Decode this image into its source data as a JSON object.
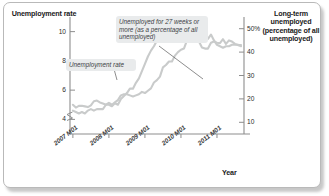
{
  "axes": {
    "y_left_title": "Unemployment rate",
    "y_right_title": "Long-term unemployed (percentage of all unemployed)",
    "x_title": "Year"
  },
  "annotations": {
    "longterm_label": "Unemployed for 27 weeks or more (as a percentage of all unemployed)",
    "unemployment_rate_label": "Unemployment rate"
  },
  "chart_data": {
    "type": "line",
    "title": "",
    "xlabel": "Year",
    "ylabel": "Unemployment rate",
    "y2label": "Long-term unemployed (percentage of all unemployed)",
    "grid": false,
    "legend": "annotations",
    "x_tick_labels": [
      "2007 M01",
      "2008 M01",
      "2009 M01",
      "2010 M01",
      "2011 M01"
    ],
    "x_tick_values": [
      2007.0,
      2008.0,
      2009.0,
      2010.0,
      2011.0
    ],
    "xlim": [
      2006.92,
      2011.75
    ],
    "ylim_left": [
      3.0,
      11.0
    ],
    "ylim_right": [
      5.0,
      55.0
    ],
    "y_left_ticks": [
      4,
      6,
      8,
      10
    ],
    "y_left_tick_labels": [
      "4",
      "6",
      "8",
      "10"
    ],
    "y_right_ticks": [
      10,
      20,
      30,
      40,
      50
    ],
    "y_right_tick_labels": [
      "10",
      "20",
      "30",
      "40",
      "50%"
    ],
    "y_left_axis_break": true,
    "line_color": "#c9cbcb",
    "series": [
      {
        "name": "Unemployment rate",
        "axis": "left",
        "units": "percent",
        "x": [
          2007.0,
          2007.083,
          2007.167,
          2007.25,
          2007.333,
          2007.417,
          2007.5,
          2007.583,
          2007.667,
          2007.75,
          2007.833,
          2007.917,
          2008.0,
          2008.083,
          2008.167,
          2008.25,
          2008.333,
          2008.417,
          2008.5,
          2008.583,
          2008.667,
          2008.75,
          2008.833,
          2008.917,
          2009.0,
          2009.083,
          2009.167,
          2009.25,
          2009.333,
          2009.417,
          2009.5,
          2009.583,
          2009.667,
          2009.75,
          2009.833,
          2009.917,
          2010.0,
          2010.083,
          2010.167,
          2010.25,
          2010.333,
          2010.417,
          2010.5,
          2010.583,
          2010.667,
          2010.75,
          2010.833,
          2010.917,
          2011.0,
          2011.083,
          2011.167,
          2011.25,
          2011.333,
          2011.417,
          2011.5,
          2011.583,
          2011.667
        ],
        "values": [
          4.6,
          4.5,
          4.4,
          4.5,
          4.4,
          4.6,
          4.7,
          4.6,
          4.7,
          4.7,
          4.7,
          5.0,
          5.0,
          4.9,
          5.1,
          5.0,
          5.4,
          5.6,
          5.8,
          6.1,
          6.1,
          6.5,
          6.8,
          7.3,
          7.8,
          8.3,
          8.7,
          9.0,
          9.4,
          9.5,
          9.5,
          9.6,
          9.8,
          10.0,
          9.9,
          9.9,
          9.8,
          9.8,
          9.9,
          9.9,
          9.6,
          9.4,
          9.5,
          9.5,
          9.5,
          9.5,
          9.8,
          9.4,
          9.1,
          9.0,
          8.9,
          9.0,
          9.0,
          9.1,
          9.1,
          9.1,
          9.0
        ]
      },
      {
        "name": "Unemployed for 27 weeks or more (as a percentage of all unemployed)",
        "axis": "right",
        "units": "percent",
        "x": [
          2007.0,
          2007.083,
          2007.167,
          2007.25,
          2007.333,
          2007.417,
          2007.5,
          2007.583,
          2007.667,
          2007.75,
          2007.833,
          2007.917,
          2008.0,
          2008.083,
          2008.167,
          2008.25,
          2008.333,
          2008.417,
          2008.5,
          2008.583,
          2008.667,
          2008.75,
          2008.833,
          2008.917,
          2009.0,
          2009.083,
          2009.167,
          2009.25,
          2009.333,
          2009.417,
          2009.5,
          2009.583,
          2009.667,
          2009.75,
          2009.833,
          2009.917,
          2010.0,
          2010.083,
          2010.167,
          2010.25,
          2010.333,
          2010.417,
          2010.5,
          2010.583,
          2010.667,
          2010.75,
          2010.833,
          2010.917,
          2011.0,
          2011.083,
          2011.167,
          2011.25,
          2011.333,
          2011.417,
          2011.5,
          2011.583,
          2011.667
        ],
        "values": [
          17.5,
          16.3,
          17.0,
          17.1,
          16.8,
          16.5,
          17.2,
          19.0,
          19.3,
          18.5,
          18.0,
          17.5,
          18.3,
          17.5,
          18.5,
          19.5,
          21.5,
          22.0,
          22.0,
          21.5,
          21.0,
          21.5,
          22.0,
          23.0,
          22.5,
          23.5,
          24.5,
          27.0,
          28.0,
          29.5,
          33.5,
          34.5,
          36.0,
          36.0,
          38.5,
          40.0,
          41.0,
          41.5,
          45.0,
          46.0,
          46.0,
          45.5,
          44.5,
          42.0,
          41.5,
          41.5,
          44.0,
          44.5,
          44.0,
          43.8,
          45.5,
          43.5,
          45.0,
          44.5,
          43.5,
          43.0,
          43.0
        ]
      }
    ]
  }
}
